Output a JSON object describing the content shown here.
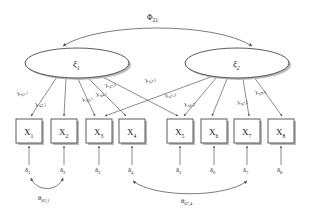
{
  "diagram": {
    "type": "sem-path-diagram",
    "background_color": "#ffffff",
    "line_color": "#5a5a5a",
    "text_color": "#1a1a1a",
    "factors": [
      {
        "id": "xi1",
        "label": "ξ",
        "subscript": "1",
        "cx": 77,
        "cy": 63,
        "rx": 52,
        "ry": 15
      },
      {
        "id": "xi2",
        "label": "ξ",
        "subscript": "2",
        "cx": 237,
        "cy": 63,
        "rx": 52,
        "ry": 15
      }
    ],
    "factor_covariance": {
      "label": "Φ",
      "subscript": "21",
      "x": 152,
      "y": 17
    },
    "indicators": [
      {
        "id": "x1",
        "label": "X",
        "subscript": "1",
        "x": 16,
        "y": 119,
        "w": 26,
        "h": 24
      },
      {
        "id": "x2",
        "label": "X",
        "subscript": "2",
        "x": 51,
        "y": 119,
        "w": 26,
        "h": 24
      },
      {
        "id": "x3",
        "label": "X",
        "subscript": "3",
        "x": 86,
        "y": 119,
        "w": 26,
        "h": 24
      },
      {
        "id": "x4",
        "label": "X",
        "subscript": "4",
        "x": 119,
        "y": 119,
        "w": 26,
        "h": 24
      },
      {
        "id": "x5",
        "label": "X",
        "subscript": "5",
        "x": 167,
        "y": 119,
        "w": 26,
        "h": 24
      },
      {
        "id": "x6",
        "label": "X",
        "subscript": "6",
        "x": 201,
        "y": 119,
        "w": 26,
        "h": 24
      },
      {
        "id": "x7",
        "label": "X",
        "subscript": "7",
        "x": 234,
        "y": 119,
        "w": 26,
        "h": 24
      },
      {
        "id": "x8",
        "label": "X",
        "subscript": "8",
        "x": 268,
        "y": 119,
        "w": 26,
        "h": 24
      }
    ],
    "errors": [
      {
        "id": "d1",
        "label": "δ",
        "subscript": "1",
        "x": 29,
        "y": 169
      },
      {
        "id": "d2",
        "label": "δ",
        "subscript": "2",
        "x": 64,
        "y": 169
      },
      {
        "id": "d3",
        "label": "δ",
        "subscript": "3",
        "x": 99,
        "y": 169
      },
      {
        "id": "d4",
        "label": "δ",
        "subscript": "4",
        "x": 132,
        "y": 169
      },
      {
        "id": "d5",
        "label": "δ",
        "subscript": "5",
        "x": 180,
        "y": 169
      },
      {
        "id": "d6",
        "label": "δ",
        "subscript": "6",
        "x": 214,
        "y": 169
      },
      {
        "id": "d7",
        "label": "δ",
        "subscript": "7",
        "x": 247,
        "y": 169
      },
      {
        "id": "d8",
        "label": "δ",
        "subscript": "8",
        "x": 281,
        "y": 169
      }
    ],
    "loadings": [
      {
        "id": "l_x1_1",
        "from": "xi1",
        "to": "x1",
        "label": "λ",
        "subscript": "X1,1",
        "x": 26,
        "y": 95,
        "rotate": -22
      },
      {
        "id": "l_x2_1",
        "from": "xi1",
        "to": "x2",
        "label": "λ",
        "subscript": "X2,1",
        "x": 44,
        "y": 106,
        "rotate": -18
      },
      {
        "id": "l_x3_1",
        "from": "xi1",
        "to": "x3",
        "label": "λ",
        "subscript": "X3,1",
        "x": 94,
        "y": 101,
        "rotate": -22
      },
      {
        "id": "l_x4_1",
        "from": "xi1",
        "to": "x4",
        "label": "λ",
        "subscript": "X4,1",
        "x": 108,
        "y": 96,
        "rotate": -22
      },
      {
        "id": "l_x5_2",
        "from": "xi2",
        "to": "x5",
        "label": "λ",
        "subscript": "X5,2",
        "x": 115,
        "y": 87,
        "rotate": -20
      },
      {
        "id": "l_x3_2",
        "from": "xi2",
        "to": "x3",
        "label": "λ",
        "subscript": "X3,2",
        "x": 155,
        "y": 82,
        "rotate": -20
      },
      {
        "id": "l_x5_2b",
        "from": "xi2",
        "to": "x5",
        "label": "λ",
        "subscript": "X5,2",
        "x": 176,
        "y": 97,
        "rotate": -20
      },
      {
        "id": "l_x6_2",
        "from": "xi2",
        "to": "x6",
        "label": "λ",
        "subscript": "X6,2",
        "x": 194,
        "y": 106,
        "rotate": -18
      },
      {
        "id": "l_x7_2",
        "from": "xi2",
        "to": "x7",
        "label": "λ",
        "subscript": "X7,2",
        "x": 247,
        "y": 104,
        "rotate": -18
      },
      {
        "id": "l_x8_2",
        "from": "xi2",
        "to": "x8",
        "label": "λ",
        "subscript": "X8,2",
        "x": 265,
        "y": 94,
        "rotate": -20
      }
    ],
    "error_covariances": [
      {
        "id": "th_d2_1",
        "between": [
          "d1",
          "d2"
        ],
        "label": "θ",
        "subscript": "δ2,1",
        "x": 47,
        "y": 198
      },
      {
        "id": "th_d7_4",
        "between": [
          "d4",
          "d7"
        ],
        "label": "θ",
        "subscript": "δ7,4",
        "x": 190,
        "y": 201
      }
    ]
  }
}
